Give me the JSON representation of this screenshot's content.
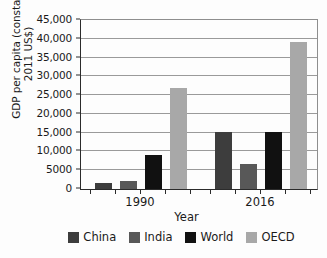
{
  "chart_data": {
    "type": "bar",
    "title": "",
    "xlabel": "Year",
    "ylabel_line1": "GDP per capita (constant",
    "ylabel_line2": "2011 US$)",
    "categories": [
      "1990",
      "2016"
    ],
    "series": [
      {
        "name": "China",
        "color": "#3d3d3d",
        "values": [
          1700,
          15100
        ]
      },
      {
        "name": "India",
        "color": "#585858",
        "values": [
          2100,
          6700
        ]
      },
      {
        "name": "World",
        "color": "#111111",
        "values": [
          9000,
          15200
        ]
      },
      {
        "name": "OECD",
        "color": "#a8a8a8",
        "values": [
          27000,
          39100
        ]
      }
    ],
    "ylim": [
      0,
      45000
    ],
    "ytick_values": [
      0,
      5000,
      10000,
      15000,
      20000,
      25000,
      30000,
      35000,
      40000,
      45000
    ],
    "ytick_labels": [
      "0",
      "5000",
      "10,000",
      "15,000",
      "20,000",
      "25,000",
      "30,000",
      "35,000",
      "40,000",
      "45,000"
    ],
    "grid": true,
    "legend_position": "bottom"
  },
  "legend": {
    "items": [
      {
        "label": "China",
        "color": "#3d3d3d"
      },
      {
        "label": "India",
        "color": "#585858"
      },
      {
        "label": "World",
        "color": "#111111"
      },
      {
        "label": "OECD",
        "color": "#a8a8a8"
      }
    ]
  },
  "axes": {
    "x_title": "Year",
    "y_title_line1": "GDP per capita (constant",
    "y_title_line2": "2011 US$)"
  }
}
